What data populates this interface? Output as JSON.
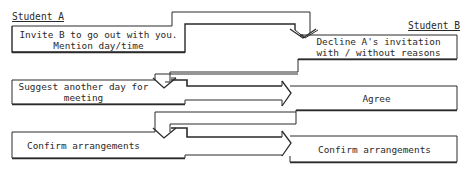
{
  "diagram": {
    "line_color": "#2a2a2a",
    "participants": {
      "a": {
        "label": "Student A"
      },
      "b": {
        "label": "Student B"
      }
    },
    "steps": [
      {
        "id": "a1",
        "speaker": "Student A",
        "lines": [
          "Invite B to go out with you.",
          "Mention day/time"
        ]
      },
      {
        "id": "b1",
        "speaker": "Student B",
        "lines": [
          "Decline A's invitation",
          "with / without reasons"
        ]
      },
      {
        "id": "a2",
        "speaker": "Student A",
        "lines": [
          "Suggest another day for",
          "meeting"
        ]
      },
      {
        "id": "b2",
        "speaker": "Student B",
        "lines": [
          "Agree"
        ]
      },
      {
        "id": "a3",
        "speaker": "Student A",
        "lines": [
          "Confirm arrangements"
        ]
      },
      {
        "id": "b3",
        "speaker": "Student B",
        "lines": [
          "Confirm arrangements"
        ]
      }
    ],
    "arrows": [
      {
        "from": "a1",
        "to": "b1",
        "direction": "down"
      },
      {
        "from": "b1",
        "to": "a2",
        "direction": "down"
      },
      {
        "from": "a2",
        "to": "b2",
        "direction": "right"
      },
      {
        "from": "b2",
        "to": "a3",
        "direction": "down"
      },
      {
        "from": "a3",
        "to": "b3",
        "direction": "right"
      }
    ]
  }
}
